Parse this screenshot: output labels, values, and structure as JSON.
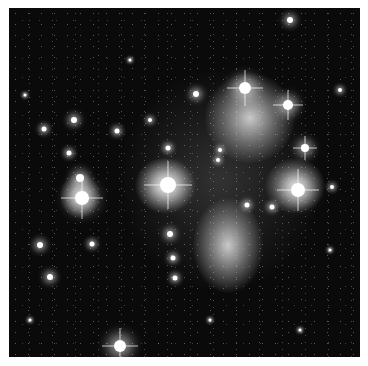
{
  "image": {
    "subject": "Pleiades star cluster with reflection nebulae",
    "style": "grayscale astronomical photograph",
    "colors": {
      "background": "#0a0a0a",
      "nebula": "#d8d8d8",
      "star": "#ffffff",
      "frame": "#ffffff"
    },
    "nebulae": [
      {
        "name": "upper-right-nebula",
        "x": 250,
        "y": 118,
        "w": 90,
        "h": 90,
        "opacity": 0.85
      },
      {
        "name": "right-nebula",
        "x": 295,
        "y": 185,
        "w": 60,
        "h": 55,
        "opacity": 0.8
      },
      {
        "name": "lower-center-nebula",
        "x": 228,
        "y": 245,
        "w": 70,
        "h": 95,
        "opacity": 0.85
      },
      {
        "name": "center-left-nebula",
        "x": 165,
        "y": 185,
        "w": 60,
        "h": 55,
        "opacity": 0.85
      },
      {
        "name": "left-nebula",
        "x": 80,
        "y": 195,
        "w": 40,
        "h": 45,
        "opacity": 0.8
      },
      {
        "name": "diffuse-haze",
        "x": 220,
        "y": 180,
        "w": 200,
        "h": 220,
        "opacity": 0.18
      }
    ],
    "stars": [
      {
        "x": 245,
        "y": 88,
        "r": 6,
        "spike": true
      },
      {
        "x": 288,
        "y": 105,
        "r": 5,
        "spike": true
      },
      {
        "x": 305,
        "y": 148,
        "r": 4,
        "spike": true
      },
      {
        "x": 298,
        "y": 190,
        "r": 7,
        "spike": true
      },
      {
        "x": 168,
        "y": 185,
        "r": 8,
        "spike": true
      },
      {
        "x": 80,
        "y": 178,
        "r": 4,
        "spike": false
      },
      {
        "x": 82,
        "y": 198,
        "r": 7,
        "spike": true
      },
      {
        "x": 120,
        "y": 346,
        "r": 6,
        "spike": true
      },
      {
        "x": 290,
        "y": 20,
        "r": 3,
        "spike": false
      },
      {
        "x": 196,
        "y": 94,
        "r": 3,
        "spike": false
      },
      {
        "x": 74,
        "y": 120,
        "r": 3,
        "spike": false
      },
      {
        "x": 44,
        "y": 129,
        "r": 2.5,
        "spike": false
      },
      {
        "x": 117,
        "y": 131,
        "r": 2.5,
        "spike": false
      },
      {
        "x": 69,
        "y": 153,
        "r": 2.5,
        "spike": false
      },
      {
        "x": 168,
        "y": 148,
        "r": 2.5,
        "spike": false
      },
      {
        "x": 40,
        "y": 245,
        "r": 3,
        "spike": false
      },
      {
        "x": 92,
        "y": 244,
        "r": 2.5,
        "spike": false
      },
      {
        "x": 50,
        "y": 277,
        "r": 3,
        "spike": false
      },
      {
        "x": 170,
        "y": 234,
        "r": 3,
        "spike": false
      },
      {
        "x": 173,
        "y": 258,
        "r": 2.5,
        "spike": false
      },
      {
        "x": 175,
        "y": 278,
        "r": 2.5,
        "spike": false
      },
      {
        "x": 247,
        "y": 205,
        "r": 2.5,
        "spike": false
      },
      {
        "x": 272,
        "y": 207,
        "r": 2.5,
        "spike": false
      },
      {
        "x": 220,
        "y": 150,
        "r": 2,
        "spike": false
      },
      {
        "x": 332,
        "y": 187,
        "r": 2,
        "spike": false
      },
      {
        "x": 218,
        "y": 160,
        "r": 2,
        "spike": false
      },
      {
        "x": 150,
        "y": 120,
        "r": 2,
        "spike": false
      },
      {
        "x": 340,
        "y": 90,
        "r": 2,
        "spike": false
      },
      {
        "x": 300,
        "y": 330,
        "r": 1.5,
        "spike": false
      },
      {
        "x": 210,
        "y": 320,
        "r": 1.5,
        "spike": false
      },
      {
        "x": 30,
        "y": 320,
        "r": 1.5,
        "spike": false
      },
      {
        "x": 330,
        "y": 250,
        "r": 1.5,
        "spike": false
      },
      {
        "x": 25,
        "y": 95,
        "r": 1.5,
        "spike": false
      },
      {
        "x": 130,
        "y": 60,
        "r": 1.5,
        "spike": false
      }
    ]
  }
}
